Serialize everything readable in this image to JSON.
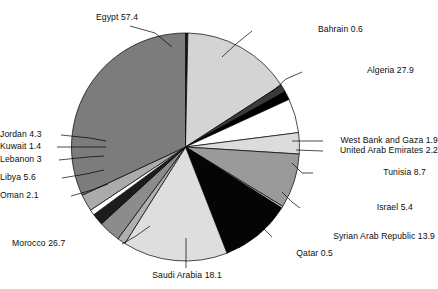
{
  "chart_data": {
    "type": "pie",
    "title": "",
    "subtitle": "",
    "xlabel": "",
    "ylabel": "",
    "legend_position": "none",
    "grid": false,
    "label_format": "name value",
    "total": 179.7,
    "start_angle_deg": 0,
    "direction": "clockwise",
    "categories": [
      "Bahrain",
      "Algeria",
      "West Bank and Gaza",
      "United Arab Emirates",
      "Tunisia",
      "Israel",
      "Syrian Arab Republic",
      "Qatar",
      "Saudi Arabia",
      "Morocco",
      "Oman",
      "Libya",
      "Lebanon",
      "Kuwait",
      "Jordan",
      "Egypt"
    ],
    "values": [
      0.6,
      27.9,
      1.9,
      2.2,
      8.7,
      5.4,
      13.9,
      0.5,
      18.1,
      26.7,
      2.1,
      5.6,
      3,
      1.4,
      4.3,
      57.4
    ],
    "slices": [
      {
        "name": "Bahrain",
        "value": 0.6,
        "label": "Bahrain  0.6",
        "color": "#1a1a1a"
      },
      {
        "name": "Algeria",
        "value": 27.9,
        "label": "Algeria  27.9",
        "color": "#d4d4d4"
      },
      {
        "name": "West Bank and Gaza",
        "value": 1.9,
        "label": "West Bank and Gaza  1.9",
        "color": "#3a3a3a"
      },
      {
        "name": "United Arab Emirates",
        "value": 2.2,
        "label": "United Arab Emirates  2.2",
        "color": "#000000"
      },
      {
        "name": "Tunisia",
        "value": 8.7,
        "label": "Tunisia  8.7",
        "color": "#ffffff"
      },
      {
        "name": "Israel",
        "value": 5.4,
        "label": "Israel  5.4",
        "color": "#dcdcdc"
      },
      {
        "name": "Syrian Arab Republic",
        "value": 13.9,
        "label": "Syrian Arab Republic  13.9",
        "color": "#9a9a9a"
      },
      {
        "name": "Qatar",
        "value": 0.5,
        "label": "Qatar  0.5",
        "color": "#c8c8c8"
      },
      {
        "name": "Saudi Arabia",
        "value": 18.1,
        "label": "Saudi Arabia  18.1",
        "color": "#050505"
      },
      {
        "name": "Morocco",
        "value": 26.7,
        "label": "Morocco  26.7",
        "color": "#dedede"
      },
      {
        "name": "Oman",
        "value": 2.1,
        "label": "Oman  2.1",
        "color": "#b0b0b0"
      },
      {
        "name": "Libya",
        "value": 5.6,
        "label": "Libya  5.6",
        "color": "#8c8c8c"
      },
      {
        "name": "Lebanon",
        "value": 3,
        "label": "Lebanon  3",
        "color": "#1c1c1c"
      },
      {
        "name": "Kuwait",
        "value": 1.4,
        "label": "Kuwait  1.4",
        "color": "#ffffff"
      },
      {
        "name": "Jordan",
        "value": 4.3,
        "label": "Jordan  4.3",
        "color": "#ababab"
      },
      {
        "name": "Egypt",
        "value": 57.4,
        "label": "Egypt  57.4",
        "color": "#7c7c7c"
      }
    ]
  },
  "labels": {
    "egypt": "Egypt  57.4",
    "bahrain": "Bahrain  0.6",
    "algeria": "Algeria  27.9",
    "west_bank_and_gaza": "West Bank and Gaza  1.9",
    "united_arab_emirates": "United Arab Emirates  2.2",
    "tunisia": "Tunisia  8.7",
    "israel": "Israel  5.4",
    "syrian_arab_republic": "Syrian Arab Republic  13.9",
    "qatar": "Qatar  0.5",
    "saudi_arabia": "Saudi Arabia  18.1",
    "morocco": "Morocco  26.7",
    "oman": "Oman  2.1",
    "libya": "Libya  5.6",
    "lebanon": "Lebanon  3",
    "kuwait": "Kuwait  1.4",
    "jordan": "Jordan  4.3"
  }
}
